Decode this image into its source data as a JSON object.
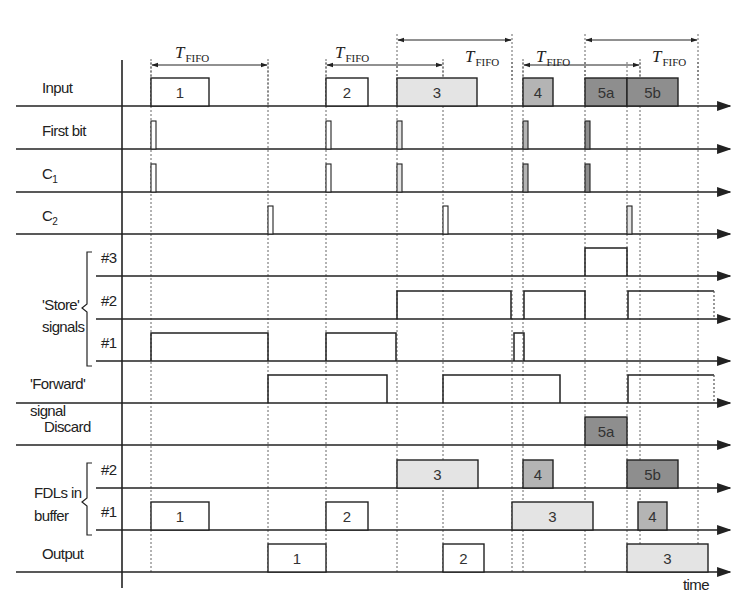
{
  "colors": {
    "white": "#ffffff",
    "light": "#e4e4e4",
    "medium": "#b4b4b4",
    "dark": "#8e8e8e",
    "line": "#222222"
  },
  "t_fifo": {
    "main": "T",
    "sub": "FIFO",
    "spans": [
      {
        "x1": 151,
        "x2": 268,
        "y": 65,
        "label_x": 175,
        "label_y": 58
      },
      {
        "x1": 326,
        "x2": 443,
        "y": 65,
        "label_x": 335,
        "label_y": 58
      },
      {
        "x1": 397,
        "x2": 512,
        "y": 40,
        "label_x": 465,
        "label_y": 62
      },
      {
        "x1": 523,
        "x2": 640,
        "y": 65,
        "label_x": 536,
        "label_y": 62
      },
      {
        "x1": 585,
        "x2": 698,
        "y": 40,
        "label_x": 652,
        "label_y": 62
      }
    ]
  },
  "time_markers": [
    151,
    268,
    326,
    397,
    443,
    512,
    523,
    585,
    627,
    640,
    698
  ],
  "rows": [
    {
      "id": "input",
      "label": "Input",
      "y": 106
    },
    {
      "id": "first-bit",
      "label": "First bit",
      "y": 149
    },
    {
      "id": "c1",
      "label": "C",
      "sub": "1",
      "y": 192
    },
    {
      "id": "c2",
      "label": "C",
      "sub": "2",
      "y": 234
    },
    {
      "id": "store-3",
      "label": "#3",
      "y": 276
    },
    {
      "id": "store-2",
      "label": "#2",
      "y": 319
    },
    {
      "id": "store-1",
      "label": "#1",
      "y": 361
    },
    {
      "id": "forward",
      "label": "",
      "y": 403
    },
    {
      "id": "discard",
      "label": "Discard",
      "y": 445
    },
    {
      "id": "fdl-2",
      "label": "#2",
      "y": 488
    },
    {
      "id": "fdl-1",
      "label": "#1",
      "y": 530
    },
    {
      "id": "output",
      "label": "Output",
      "y": 572
    }
  ],
  "group_labels": {
    "store": [
      "'Store'",
      "signals"
    ],
    "forward": [
      "'Forward'",
      "signal"
    ],
    "fdl": [
      "FDLs in",
      "buffer"
    ]
  },
  "x_axis_label": "time",
  "packets": {
    "input": [
      {
        "label": "1",
        "x1": 151,
        "x2": 209,
        "shade": "white"
      },
      {
        "label": "2",
        "x1": 326,
        "x2": 368,
        "shade": "white"
      },
      {
        "label": "3",
        "x1": 397,
        "x2": 477,
        "shade": "light"
      },
      {
        "label": "4",
        "x1": 523,
        "x2": 553,
        "shade": "medium"
      },
      {
        "label": "5a",
        "x1": 585,
        "x2": 627,
        "shade": "dark"
      },
      {
        "label": "5b",
        "x1": 627,
        "x2": 678,
        "shade": "dark"
      }
    ],
    "discard": [
      {
        "label": "5a",
        "x1": 585,
        "x2": 627,
        "shade": "dark"
      }
    ],
    "fdl-2": [
      {
        "label": "3",
        "x1": 397,
        "x2": 478,
        "shade": "light"
      },
      {
        "label": "4",
        "x1": 523,
        "x2": 553,
        "shade": "medium"
      },
      {
        "label": "5b",
        "x1": 627,
        "x2": 678,
        "shade": "dark"
      }
    ],
    "fdl-1": [
      {
        "label": "1",
        "x1": 151,
        "x2": 209,
        "shade": "white"
      },
      {
        "label": "2",
        "x1": 326,
        "x2": 368,
        "shade": "white"
      },
      {
        "label": "3",
        "x1": 512,
        "x2": 593,
        "shade": "light"
      },
      {
        "label": "4",
        "x1": 638,
        "x2": 667,
        "shade": "medium"
      }
    ],
    "output": [
      {
        "label": "1",
        "x1": 268,
        "x2": 326,
        "shade": "white"
      },
      {
        "label": "2",
        "x1": 443,
        "x2": 484,
        "shade": "white"
      },
      {
        "label": "3",
        "x1": 627,
        "x2": 708,
        "shade": "light"
      }
    ]
  },
  "pulses": {
    "first-bit": [
      {
        "x": 151,
        "shade": "white"
      },
      {
        "x": 326,
        "shade": "white"
      },
      {
        "x": 397,
        "shade": "light"
      },
      {
        "x": 523,
        "shade": "medium"
      },
      {
        "x": 585,
        "shade": "dark"
      }
    ],
    "c1": [
      {
        "x": 151,
        "shade": "white"
      },
      {
        "x": 326,
        "shade": "white"
      },
      {
        "x": 397,
        "shade": "light"
      },
      {
        "x": 523,
        "shade": "medium"
      },
      {
        "x": 585,
        "shade": "dark"
      }
    ],
    "c2": [
      {
        "x": 268,
        "shade": "white"
      },
      {
        "x": 443,
        "shade": "white"
      },
      {
        "x": 627,
        "shade": "light"
      }
    ]
  },
  "levels": {
    "store-3": [
      {
        "x1": 585,
        "x2": 627
      }
    ],
    "store-2": [
      {
        "x1": 397,
        "x2": 511
      },
      {
        "x1": 524,
        "x2": 585
      },
      {
        "x1": 628,
        "x2": 714,
        "open_end": true
      }
    ],
    "store-1": [
      {
        "x1": 151,
        "x2": 268
      },
      {
        "x1": 326,
        "x2": 396
      },
      {
        "x1": 514,
        "x2": 524
      }
    ],
    "forward": [
      {
        "x1": 268,
        "x2": 387
      },
      {
        "x1": 443,
        "x2": 560
      },
      {
        "x1": 628,
        "x2": 714,
        "open_end": true
      }
    ]
  }
}
